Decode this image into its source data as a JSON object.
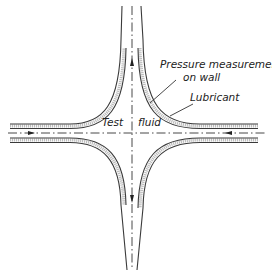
{
  "figure": {
    "type": "four-roll-mill / cross-slot flow schematic",
    "labels": {
      "pressure_line1": "Pressure measurement",
      "pressure_line2": "on wall",
      "lubricant": "Lubricant",
      "test": "Test",
      "fluid": "fluid"
    },
    "flow_arrows": {
      "left": "inflow-right",
      "right": "inflow-left",
      "top": "outflow-up",
      "bottom": "outflow-down"
    },
    "colors": {
      "line": "#3a3a3a",
      "lubricant_band": "#bdbdbd",
      "background": "#ffffff"
    }
  }
}
